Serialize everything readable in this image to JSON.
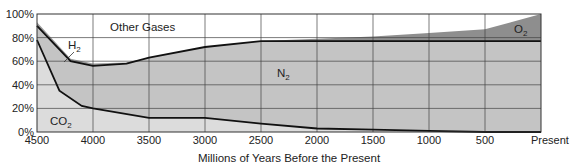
{
  "chart_data": {
    "type": "area",
    "title": "",
    "xlabel": "Millions of Years Before the Present",
    "ylabel": "",
    "x_tick_labels": [
      "4500",
      "4000",
      "3500",
      "3000",
      "2500",
      "2000",
      "1500",
      "1000",
      "500",
      "Present"
    ],
    "x": [
      4500,
      4000,
      3500,
      3000,
      2500,
      2000,
      1500,
      1000,
      500,
      0
    ],
    "y_tick_labels": [
      "0%",
      "20%",
      "40%",
      "60%",
      "80%",
      "100%"
    ],
    "ylim": [
      0,
      100
    ],
    "xlim": [
      4500,
      0
    ],
    "grid": true,
    "legend": "inline labels",
    "stacked": true,
    "series": [
      {
        "name": "CO2",
        "label": "CO",
        "label_sub": "2",
        "color": "#dcdcdc",
        "boundary_top": [
          {
            "x": 4500,
            "y": 78
          },
          {
            "x": 4300,
            "y": 35
          },
          {
            "x": 4100,
            "y": 22
          },
          {
            "x": 4000,
            "y": 20
          },
          {
            "x": 3500,
            "y": 12
          },
          {
            "x": 3000,
            "y": 12
          },
          {
            "x": 2500,
            "y": 7
          },
          {
            "x": 2000,
            "y": 3
          },
          {
            "x": 1500,
            "y": 2
          },
          {
            "x": 1000,
            "y": 1
          },
          {
            "x": 500,
            "y": 0
          },
          {
            "x": 0,
            "y": 0
          }
        ]
      },
      {
        "name": "N2",
        "label": "N",
        "label_sub": "2",
        "color": "#c4c4c4",
        "boundary_top": [
          {
            "x": 4500,
            "y": 90
          },
          {
            "x": 4200,
            "y": 60
          },
          {
            "x": 4000,
            "y": 56
          },
          {
            "x": 3700,
            "y": 58
          },
          {
            "x": 3500,
            "y": 63
          },
          {
            "x": 3000,
            "y": 72
          },
          {
            "x": 2500,
            "y": 77
          },
          {
            "x": 2000,
            "y": 77
          },
          {
            "x": 1500,
            "y": 77
          },
          {
            "x": 1000,
            "y": 77
          },
          {
            "x": 500,
            "y": 77
          },
          {
            "x": 0,
            "y": 77
          }
        ]
      },
      {
        "name": "H2",
        "label": "H",
        "label_sub": "2",
        "color": "#9a9a9a",
        "boundary_top": [
          {
            "x": 4500,
            "y": 93
          },
          {
            "x": 4200,
            "y": 62
          },
          {
            "x": 4000,
            "y": 58
          },
          {
            "x": 3700,
            "y": 59
          },
          {
            "x": 3500,
            "y": 63
          }
        ]
      },
      {
        "name": "O2",
        "label": "O",
        "label_sub": "2",
        "color": "#8e8e8e",
        "boundary_top": [
          {
            "x": 2500,
            "y": 77
          },
          {
            "x": 2000,
            "y": 79
          },
          {
            "x": 1500,
            "y": 81
          },
          {
            "x": 1000,
            "y": 84
          },
          {
            "x": 500,
            "y": 87
          },
          {
            "x": 0,
            "y": 100
          }
        ]
      },
      {
        "name": "Other Gases",
        "label": "Other Gases",
        "label_sub": "",
        "color": "#ffffff",
        "boundary_top": [
          {
            "x": 4500,
            "y": 100
          },
          {
            "x": 0,
            "y": 100
          }
        ]
      }
    ]
  }
}
